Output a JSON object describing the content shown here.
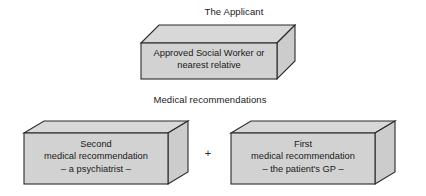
{
  "diagram": {
    "type": "flow-diagram",
    "title": "",
    "sections": [
      {
        "heading": "The Applicant",
        "boxes": [
          {
            "id": "applicant",
            "lines": [
              "Approved Social Worker or",
              "nearest relative"
            ]
          }
        ]
      },
      {
        "heading": "Medical recommendations",
        "connector": "+",
        "boxes": [
          {
            "id": "second-recommendation",
            "lines": [
              "Second",
              "medical recommendation",
              "– a psychiatrist –"
            ]
          },
          {
            "id": "first-recommendation",
            "lines": [
              "First",
              "medical recommendation",
              "– the patient's GP –"
            ]
          }
        ]
      }
    ]
  },
  "headings": {
    "applicant": "The Applicant",
    "medical": "Medical recommendations"
  },
  "boxes": {
    "applicant": {
      "line1": "Approved Social Worker or",
      "line2": "nearest relative"
    },
    "second": {
      "line1": "Second",
      "line2": "medical recommendation",
      "line3": "– a psychiatrist –"
    },
    "first": {
      "line1": "First",
      "line2": "medical recommendation",
      "line3": "– the patient's GP –"
    }
  },
  "connector": {
    "plus": "+"
  },
  "colors": {
    "front_face": "#d2d2d2",
    "top_face": "#d8d8d8",
    "side_face": "#cccccc",
    "outline": "#2b2b2b",
    "background": "#ffffff",
    "text": "#1a1a1a"
  }
}
